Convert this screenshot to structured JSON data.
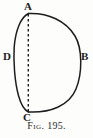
{
  "figure": {
    "caption_prefix": "Fig.",
    "caption_number": "195.",
    "caption_full": "Fig. 195.",
    "background_color": "#fdfdfc",
    "ink_color": "#1d1d1d",
    "labels": [
      {
        "text": "A",
        "role": "top-vertex",
        "x": 28,
        "y": 13
      },
      {
        "text": "B",
        "role": "right-arc-point",
        "x": 80,
        "y": 57
      },
      {
        "text": "C",
        "role": "bottom-vertex",
        "x": 28,
        "y": 112
      },
      {
        "text": "D",
        "role": "left-arc-point",
        "x": 14,
        "y": 57
      }
    ],
    "geometry": {
      "description": "Two circular arcs meeting at points A and C enclosing a lens-shaped region, with a dashed chord joining A and C.",
      "points": {
        "A": {
          "x": 28,
          "y": 13
        },
        "B": {
          "x": 80,
          "y": 57
        },
        "C": {
          "x": 28,
          "y": 112
        },
        "D": {
          "x": 14,
          "y": 57
        }
      },
      "arcs": [
        {
          "name": "major-arc-ABC",
          "from": "A",
          "through": "B",
          "to": "C",
          "style": "solid",
          "bulge": "right"
        },
        {
          "name": "minor-arc-ADC",
          "from": "A",
          "through": "D",
          "to": "C",
          "style": "solid",
          "bulge": "left"
        }
      ],
      "chords": [
        {
          "name": "chord-AC",
          "from": "A",
          "to": "C",
          "style": "dashed"
        }
      ]
    }
  }
}
